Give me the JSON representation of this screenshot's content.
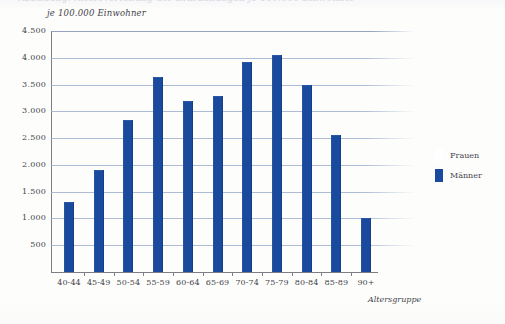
{
  "page": {
    "cutoff_header_text": "Abbildung: Altersverteilung der Erkrankungen je 100.000 Einwohner"
  },
  "chart_data": {
    "type": "bar",
    "title": "",
    "subtitle": "je 100.000 Einwohner",
    "xlabel": "Altersgruppe",
    "ylabel": "",
    "categories": [
      "40-44",
      "45-49",
      "50-54",
      "55-59",
      "60-64",
      "65-69",
      "70-74",
      "75-79",
      "80-84",
      "85-89",
      "90+"
    ],
    "series": [
      {
        "name": "Frauen",
        "color": "#ffffff",
        "values": [
          null,
          null,
          null,
          null,
          null,
          null,
          null,
          null,
          null,
          null,
          null
        ]
      },
      {
        "name": "Männer",
        "color": "#1a4a9e",
        "values": [
          1300,
          1900,
          2830,
          3650,
          3200,
          3280,
          3920,
          4050,
          3500,
          2560,
          1000
        ]
      }
    ],
    "ylim": [
      0,
      4500
    ],
    "ytick_values": [
      500,
      1000,
      1500,
      2000,
      2500,
      3000,
      3500,
      4000,
      4500
    ],
    "ytick_labels": [
      "500",
      "1.000",
      "1.500",
      "2.000",
      "2.500",
      "3.000",
      "3.500",
      "4.000",
      "4.500"
    ],
    "grid": true,
    "legend_position": "right",
    "legend": [
      {
        "label": "Frauen",
        "color": "#ffffff"
      },
      {
        "label": "Männer",
        "color": "#1a4a9e"
      }
    ],
    "colors": {
      "bar": "#1a4a9e",
      "gridline": "#9fb0cf",
      "axis": "#7d7d84",
      "background": "#fdfdfb",
      "text": "#45454c"
    }
  }
}
